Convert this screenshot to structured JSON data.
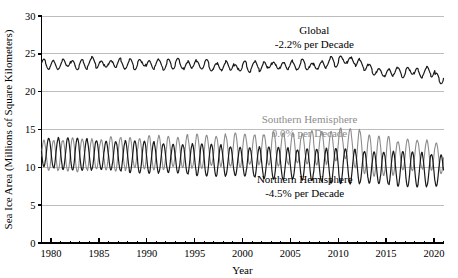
{
  "chart_data": {
    "type": "line",
    "title": "",
    "xlabel": "Year",
    "ylabel": "Sea Ice Area (Millions of Square Kilometers)",
    "xlim": [
      1979,
      2021
    ],
    "ylim": [
      0,
      30
    ],
    "ytick_labels": [
      "0",
      "5",
      "10",
      "15",
      "20",
      "25",
      "30"
    ],
    "ytick_values": [
      0,
      5,
      10,
      15,
      20,
      25,
      30
    ],
    "xtick_labels": [
      "1980",
      "1985",
      "1990",
      "1995",
      "2000",
      "2005",
      "2010",
      "2015",
      "2020"
    ],
    "xtick_values": [
      1980,
      1985,
      1990,
      1995,
      2000,
      2005,
      2010,
      2015,
      2020
    ],
    "minor_xtick_interval": 1,
    "grid": "horizontal",
    "legend": "inline-annotations",
    "series": [
      {
        "name": "Global",
        "color": "#1a1a1a",
        "trend_label": "-2.2% per Decade",
        "annotation_lines": [
          "Global",
          "-2.2% per Decade"
        ],
        "annotation_x": 2007.5,
        "annotation_y": 27.6,
        "monthly_mean": 23.6,
        "seasonal_amplitude": 0.55,
        "decadal_trend_percent": -2.2,
        "values": [
          23.75,
          23.5,
          23.6,
          23.45,
          23.55,
          23.75,
          23.9,
          23.55,
          23.45,
          23.7,
          23.5,
          23.85,
          24.1,
          23.65,
          23.5,
          23.8,
          23.55,
          23.75,
          23.9,
          23.5,
          23.6,
          23.8,
          23.45,
          23.7,
          23.95,
          23.55,
          23.5,
          23.8,
          23.65,
          23.4,
          23.75,
          23.55,
          23.85,
          23.6,
          23.3,
          23.6,
          23.8,
          23.45,
          23.55,
          23.7,
          23.3,
          23.15,
          23.45,
          23.25,
          23.55,
          23.4,
          23.0,
          23.3,
          23.5,
          23.1,
          23.35,
          23.6,
          23.2,
          23.4,
          23.7,
          23.35,
          23.55,
          23.3,
          23.45,
          23.65,
          23.3,
          23.5,
          23.75,
          23.45,
          23.2,
          23.55,
          23.35,
          23.6,
          23.9,
          24.1,
          23.8,
          24.15,
          24.3,
          23.95,
          24.2,
          23.85,
          23.6,
          23.35,
          23.05,
          22.75,
          22.5,
          22.6,
          22.35,
          22.55,
          22.8,
          22.6,
          22.4,
          22.65,
          22.85,
          22.55,
          22.35,
          22.6,
          22.8,
          22.5,
          21.9,
          21.6,
          21.75
        ]
      },
      {
        "name": "Southern Hemisphere",
        "color": "#8c8c8c",
        "trend_label": "0.0% per Decade",
        "annotation_lines": [
          "Southern Hemisphere",
          "0.0% per Decade"
        ],
        "annotation_x": 2007.0,
        "annotation_y": 15.9,
        "monthly_mean": 11.6,
        "seasonal_amplitude": 2.1,
        "decadal_trend_percent": 0.0,
        "peak_years": [
          2013,
          2014,
          2015
        ],
        "values": [
          11.5,
          11.7,
          11.4,
          11.6,
          11.75,
          11.45,
          11.6,
          11.8,
          11.5,
          11.65,
          11.85,
          11.5,
          11.7,
          11.9,
          11.55,
          11.75,
          11.95,
          11.6,
          11.8,
          12.0,
          11.65,
          11.85,
          12.05,
          11.7,
          11.9,
          12.1,
          11.75,
          11.95,
          12.15,
          11.8,
          12.0,
          12.2,
          11.85,
          12.05,
          12.25,
          11.9,
          12.1,
          12.3,
          11.95,
          12.15,
          12.35,
          12.0,
          12.2,
          12.4,
          12.05,
          12.25,
          12.45,
          12.1,
          12.3,
          12.5,
          12.15,
          12.35,
          12.55,
          12.2,
          12.4,
          12.6,
          12.25,
          12.45,
          12.65,
          12.3,
          12.5,
          12.7,
          12.35,
          12.55,
          12.75,
          12.4,
          12.6,
          12.8,
          12.45,
          12.65,
          12.95,
          13.1,
          13.25,
          13.0,
          12.75,
          12.4,
          12.1,
          11.85,
          11.6,
          11.5,
          11.45,
          11.6,
          11.4,
          11.55,
          11.7,
          11.45,
          11.6,
          11.8,
          11.5,
          11.65,
          11.85,
          11.5,
          11.7,
          11.55,
          11.3,
          11.1,
          11.25
        ]
      },
      {
        "name": "Northern Hemisphere",
        "color": "#1a1a1a",
        "trend_label": "-4.5% per Decade",
        "annotation_lines": [
          "Northern Hemisphere",
          "-4.5% per Decade"
        ],
        "annotation_x": 2006.5,
        "annotation_y": 7.9,
        "monthly_mean": 11.2,
        "seasonal_amplitude": 2.0,
        "decadal_trend_percent": -4.5,
        "values": [
          12.1,
          11.85,
          12.0,
          11.75,
          11.95,
          11.7,
          11.9,
          11.65,
          11.85,
          11.6,
          11.8,
          11.55,
          11.75,
          11.5,
          11.7,
          11.45,
          11.65,
          11.4,
          11.6,
          11.35,
          11.55,
          11.3,
          11.5,
          11.25,
          11.45,
          11.2,
          11.4,
          11.15,
          11.35,
          11.1,
          11.3,
          11.05,
          11.25,
          11.0,
          11.2,
          10.95,
          11.15,
          10.9,
          11.1,
          10.85,
          11.05,
          10.8,
          11.0,
          10.75,
          10.95,
          10.7,
          10.9,
          10.65,
          10.85,
          10.6,
          10.8,
          10.55,
          10.75,
          10.5,
          10.7,
          10.45,
          10.65,
          10.4,
          10.6,
          10.35,
          10.55,
          10.3,
          10.5,
          10.25,
          10.45,
          10.2,
          10.4,
          10.15,
          10.35,
          10.1,
          10.3,
          10.05,
          10.25,
          10.0,
          10.2,
          9.95,
          10.15,
          9.9,
          10.1,
          9.85,
          10.05,
          9.8,
          10.0,
          9.75,
          9.95,
          9.7,
          9.9,
          9.65,
          9.85,
          9.6,
          9.8,
          9.55,
          9.75,
          9.5,
          9.7,
          9.45,
          9.65
        ]
      }
    ]
  },
  "colors": {
    "series_dark": "#1a1a1a",
    "series_gray": "#8c8c8c",
    "gridline": "#bdbdbd",
    "axis": "#000000",
    "background": "#ffffff"
  }
}
